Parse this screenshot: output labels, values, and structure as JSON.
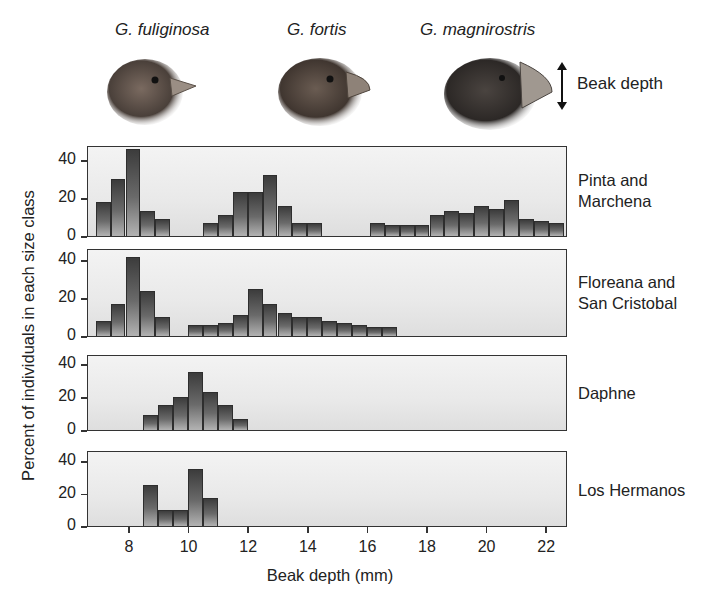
{
  "header": {
    "species": [
      {
        "label": "G. fuliginosa",
        "x": 115
      },
      {
        "label": "G. fortis",
        "x": 287
      },
      {
        "label": "G. magnirostris",
        "x": 420
      }
    ],
    "beak_depth_label": "Beak depth"
  },
  "axis": {
    "ylabel": "Percent of individuals in each size class",
    "xlabel": "Beak depth (mm)",
    "xticks": [
      "8",
      "10",
      "12",
      "14",
      "16",
      "18",
      "20",
      "22"
    ],
    "yticks": [
      "0",
      "20",
      "40"
    ]
  },
  "panels": [
    {
      "island": "Pinta and\nMarchena"
    },
    {
      "island": "Floreana and\nSan Cristobal"
    },
    {
      "island": "Daphne"
    },
    {
      "island": "Los Hermanos"
    }
  ],
  "colors": {
    "bar_dark": "#3c3c3c",
    "bar_light": "#b3b3b3",
    "panel_bg": "#ececec",
    "axis": "#333333"
  },
  "chart_data": {
    "type": "bar",
    "xlabel": "Beak depth (mm)",
    "ylabel": "Percent of individuals in each size class",
    "xlim": [
      6.6,
      22.7
    ],
    "ylim": [
      0,
      48
    ],
    "bin_width_mm": 0.5,
    "species_legend": [
      "G. fuliginosa",
      "G. fortis",
      "G. magnirostris"
    ],
    "grid": false,
    "series": [
      {
        "name": "Pinta and Marchena",
        "bin_centers": [
          7.1,
          7.6,
          8.1,
          8.6,
          9.1,
          10.7,
          11.2,
          11.7,
          12.2,
          12.7,
          13.2,
          13.7,
          14.2,
          16.3,
          16.8,
          17.3,
          17.8,
          18.3,
          18.8,
          19.3,
          19.8,
          20.3,
          20.8,
          21.3,
          21.8,
          22.3
        ],
        "values": [
          18,
          30,
          46,
          13,
          9,
          7,
          11,
          23,
          23,
          32,
          16,
          7,
          7,
          7,
          6,
          6,
          6,
          11,
          13,
          12,
          16,
          14,
          19,
          9,
          8,
          7
        ]
      },
      {
        "name": "Floreana and San Cristobal",
        "bin_centers": [
          7.1,
          7.6,
          8.1,
          8.6,
          9.1,
          10.2,
          10.7,
          11.2,
          11.7,
          12.2,
          12.7,
          13.2,
          13.7,
          14.2,
          14.7,
          15.2,
          15.7,
          16.2,
          16.7
        ],
        "values": [
          8,
          17,
          42,
          24,
          10,
          6,
          6,
          7,
          11,
          25,
          17,
          12,
          10,
          10,
          8,
          7,
          6,
          5,
          5
        ]
      },
      {
        "name": "Daphne",
        "bin_centers": [
          8.7,
          9.2,
          9.7,
          10.2,
          10.7,
          11.2,
          11.7
        ],
        "values": [
          9,
          15,
          20,
          35,
          23,
          15,
          7
        ]
      },
      {
        "name": "Los Hermanos",
        "bin_centers": [
          8.7,
          9.2,
          9.7,
          10.2,
          10.7
        ],
        "values": [
          25,
          10,
          10,
          35,
          17
        ]
      }
    ]
  }
}
